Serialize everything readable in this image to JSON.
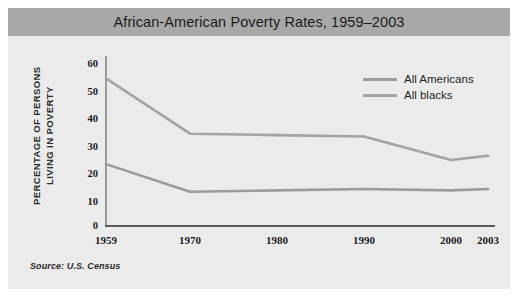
{
  "figure": {
    "background_color": "#ffffff",
    "card_color": "#ebebeb",
    "title_band_color": "#a8a8a8"
  },
  "title": "African-American Poverty Rates, 1959–2003",
  "source_note": "Source: U.S. Census",
  "ylabel_line1": "PERCENTAGE OF PERSONS",
  "ylabel_line2": "LIVING IN POVERTY",
  "legend": {
    "position": "upper-right-inside",
    "entries": [
      {
        "label": "All Americans",
        "color": "#9b9b9b"
      },
      {
        "label": "All blacks",
        "color": "#a3a3a3"
      }
    ]
  },
  "axis": {
    "y_ticks": [
      "0",
      "10",
      "20",
      "30",
      "40",
      "50",
      "60"
    ],
    "x_ticks": [
      "1959",
      "1970",
      "1980",
      "1990",
      "2000",
      "2003"
    ]
  },
  "chart_data": {
    "type": "line",
    "title": "African-American Poverty Rates, 1959–2003",
    "xlabel": "",
    "ylabel": "PERCENTAGE OF PERSONS LIVING IN POVERTY",
    "source": "Source: U.S. Census",
    "x": [
      1959,
      1970,
      1980,
      1990,
      2000,
      2003
    ],
    "x_tick_labels": [
      "1959",
      "1970",
      "1980",
      "1990",
      "2000",
      "2003"
    ],
    "xlim": [
      1959,
      2003
    ],
    "ylim": [
      0,
      60
    ],
    "y_ticks": [
      0,
      10,
      20,
      30,
      40,
      50,
      60
    ],
    "grid": false,
    "legend": [
      "All Americans",
      "All blacks"
    ],
    "series": [
      {
        "name": "All blacks",
        "color": "#a3a3a3",
        "values": [
          53,
          33,
          32.5,
          32,
          23.5,
          25
        ]
      },
      {
        "name": "All Americans",
        "color": "#9b9b9b",
        "values": [
          22,
          12,
          12.5,
          13,
          12.5,
          13
        ]
      }
    ]
  }
}
